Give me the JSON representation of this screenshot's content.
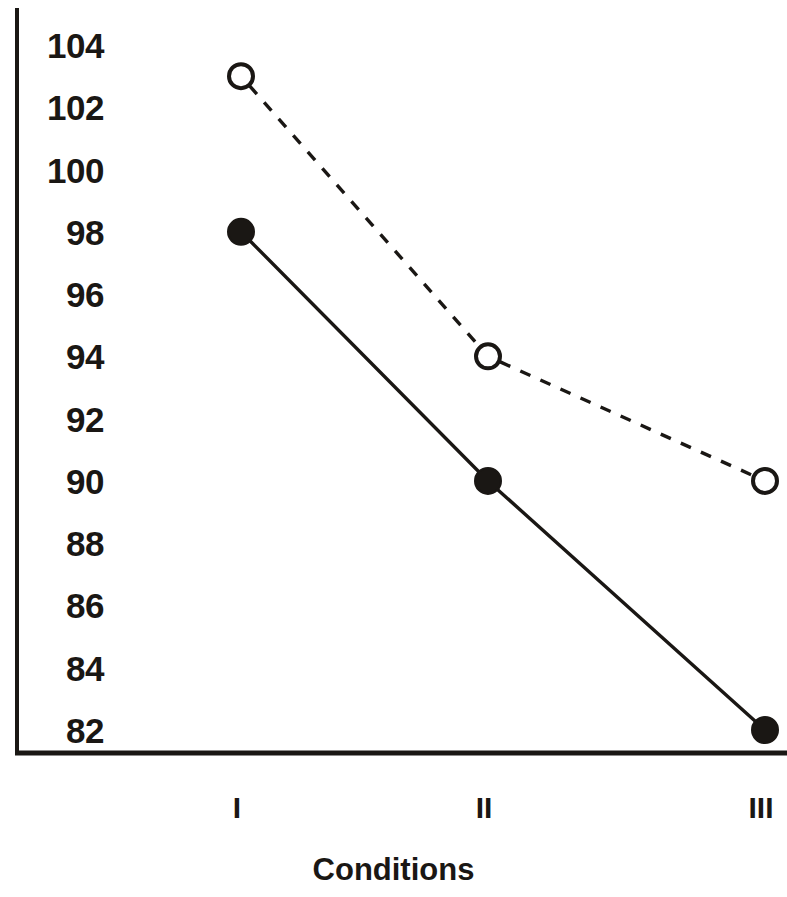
{
  "chart_data": {
    "type": "line",
    "title": "",
    "xlabel": "Conditions",
    "ylabel": "",
    "categories": [
      "I",
      "II",
      "III"
    ],
    "ylim": [
      82,
      104
    ],
    "ytick_values": [
      104,
      102,
      100,
      98,
      96,
      94,
      92,
      90,
      88,
      86,
      84,
      82
    ],
    "ytick_labels": [
      "104",
      "102",
      "100",
      "98",
      "96",
      "94",
      "92",
      "90",
      "88",
      "86",
      "84",
      "82"
    ],
    "ytick_step": 2,
    "grid": false,
    "legend": "none",
    "axis_color": "#1a1714",
    "series": [
      {
        "name": "solid-filled-series",
        "values": [
          98,
          90,
          82
        ],
        "line_style": "solid",
        "marker": "filled-circle",
        "color": "#1a1714"
      },
      {
        "name": "dashed-open-series",
        "values": [
          103,
          94,
          90
        ],
        "line_style": "dashed",
        "marker": "open-circle",
        "color": "#1a1714"
      }
    ]
  },
  "axis": {
    "x_title": "Conditions"
  }
}
